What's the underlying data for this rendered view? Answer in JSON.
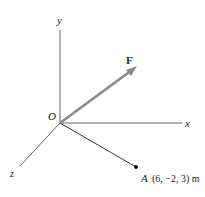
{
  "diagram": {
    "axes": {
      "x_label": "x",
      "y_label": "y",
      "z_label": "z",
      "origin_label": "O"
    },
    "force": {
      "label": "F",
      "color": "#8a8a8a"
    },
    "point": {
      "name": "A",
      "coords": "(6, −2, 3) m"
    }
  }
}
